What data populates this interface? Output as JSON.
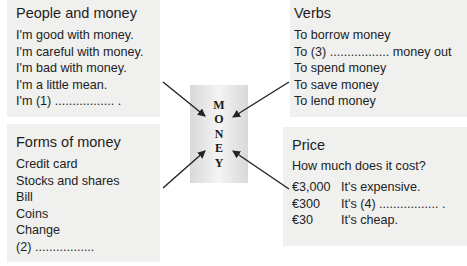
{
  "people": {
    "title": "People and money",
    "lines": [
      "I'm good with money.",
      "I'm careful with money.",
      "I'm bad with money.",
      "I'm a little mean.",
      "I'm (1) ................. ."
    ]
  },
  "forms": {
    "title": "Forms of money",
    "lines": [
      "Credit card",
      "Stocks and shares",
      "Bill",
      "Coins",
      "Change",
      "(2) ................."
    ]
  },
  "verbs": {
    "title": "Verbs",
    "lines": [
      "To borrow money",
      "To (3) ................. money out",
      "To spend money",
      "To save money",
      "To lend money"
    ]
  },
  "price": {
    "title": "Price",
    "question": "How much does it cost?",
    "rows": [
      {
        "amount": "€3,000",
        "text": "It's expensive."
      },
      {
        "amount": "€300",
        "text": "It's (4) ................. ."
      },
      {
        "amount": "€30",
        "text": "It's cheap."
      }
    ]
  },
  "center": {
    "letters": [
      "M",
      "O",
      "N",
      "E",
      "Y"
    ]
  },
  "colors": {
    "box_bg": "#f0f0ef",
    "arrow": "#222222"
  }
}
